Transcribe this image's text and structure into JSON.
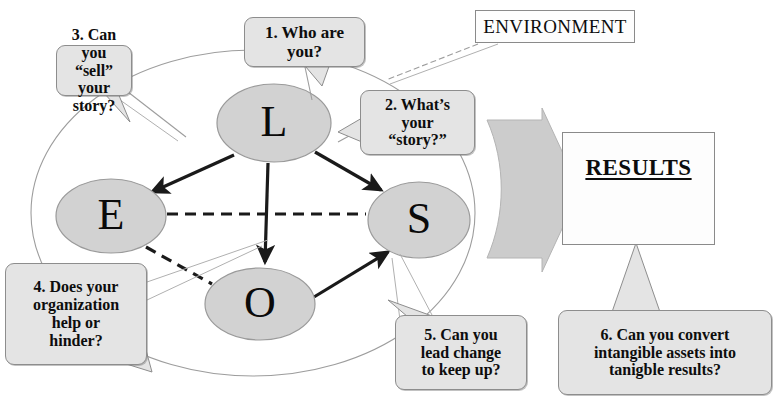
{
  "diagram": {
    "nodes": [
      {
        "id": "L",
        "label": "L",
        "cx": 274,
        "cy": 123,
        "rx": 57,
        "ry": 39
      },
      {
        "id": "E",
        "label": "E",
        "cx": 111,
        "cy": 216,
        "rx": 55,
        "ry": 37
      },
      {
        "id": "S",
        "label": "S",
        "cx": 419,
        "cy": 220,
        "rx": 51,
        "ry": 38
      },
      {
        "id": "O",
        "label": "O",
        "cx": 260,
        "cy": 304,
        "rx": 55,
        "ry": 36
      }
    ],
    "environment": {
      "label": "ENVIRONMENT",
      "x": 475,
      "y": 10,
      "w": 160,
      "h": 33
    },
    "results": {
      "label": "RESULTS",
      "x": 562,
      "y": 132,
      "w": 153,
      "h": 113
    },
    "callouts": [
      {
        "id": "c1",
        "lines": [
          "1. Who are",
          "you?"
        ],
        "x": 244,
        "y": 17,
        "w": 121,
        "h": 50,
        "font_size": 17
      },
      {
        "id": "c2",
        "lines": [
          "2. What’s",
          "your",
          "“story?”"
        ],
        "x": 360,
        "y": 90,
        "w": 115,
        "h": 65,
        "font_size": 16
      },
      {
        "id": "c3",
        "lines": [
          "3. Can you",
          "“sell” your",
          "story?"
        ],
        "x": 56,
        "y": 45,
        "w": 76,
        "h": 51,
        "font_size": 16
      },
      {
        "id": "c4",
        "lines": [
          "4. Does your",
          "organization",
          "help or",
          "hinder?"
        ],
        "x": 5,
        "y": 263,
        "w": 142,
        "h": 102,
        "font_size": 16
      },
      {
        "id": "c5",
        "lines": [
          "5. Can you",
          "lead change",
          "to keep up?"
        ],
        "x": 395,
        "y": 315,
        "w": 132,
        "h": 75,
        "font_size": 16
      },
      {
        "id": "c6",
        "lines": [
          "6. Can you convert",
          "intangible assets into",
          "tanigble results?"
        ],
        "x": 558,
        "y": 310,
        "w": 214,
        "h": 85,
        "font_size": 16
      }
    ],
    "colors": {
      "node_fill": "#d2d2d2",
      "node_stroke": "#9a9a9a",
      "callout_fill": "#e4e4e4",
      "callout_stroke": "#8d8d8d",
      "arrow_solid": "#1a1a1a",
      "arrow_dashed": "#1a1a1a",
      "big_arrow_fill": "#cccccc",
      "big_arrow_stroke": "#b4b4b4",
      "outer_ellipse_stroke": "#9d9d9d",
      "box_fill": "#fdfdfd",
      "box_stroke": "#8a8a8a",
      "text": "#0d0d0d",
      "background": "#ffffff"
    },
    "connections": [
      {
        "from": "L",
        "to": "E",
        "style": "solid-arrow"
      },
      {
        "from": "L",
        "to": "S",
        "style": "solid-arrow"
      },
      {
        "from": "L",
        "to": "O",
        "style": "solid-arrow"
      },
      {
        "from": "O",
        "to": "S",
        "style": "solid-arrow"
      },
      {
        "from": "E",
        "to": "S",
        "style": "dashed"
      },
      {
        "from": "E",
        "to": "O",
        "style": "dashed"
      }
    ]
  }
}
